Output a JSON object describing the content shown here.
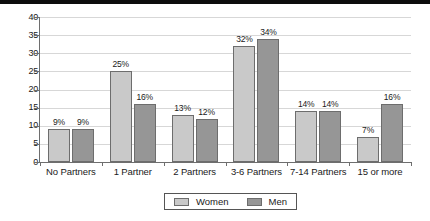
{
  "chart_data": {
    "type": "bar",
    "title": "",
    "subtitle": "",
    "xlabel": "",
    "ylabel": "",
    "ylim": [
      0,
      40
    ],
    "ytick_step": 5,
    "yticks": [
      "0",
      "5",
      "10",
      "15",
      "20",
      "25",
      "30",
      "35",
      "40"
    ],
    "grid": true,
    "legend_position": "bottom-center",
    "categories": [
      "No Partners",
      "1 Partner",
      "2 Partners",
      "3-6 Partners",
      "7-14 Partners",
      "15 or more"
    ],
    "series": [
      {
        "name": "Women",
        "color": "#c9c9c9",
        "values": [
          9,
          25,
          13,
          32,
          14,
          7
        ],
        "labels": [
          "9%",
          "25%",
          "13%",
          "32%",
          "14%",
          "7%"
        ]
      },
      {
        "name": "Men",
        "color": "#969696",
        "values": [
          9,
          16,
          12,
          34,
          14,
          16
        ],
        "labels": [
          "9%",
          "16%",
          "12%",
          "34%",
          "14%",
          "16%"
        ]
      }
    ]
  },
  "legend": {
    "items": [
      {
        "label": "Women"
      },
      {
        "label": "Men"
      }
    ]
  },
  "colors": {
    "women": "#c9c9c9",
    "men": "#969696",
    "grid": "#d7d7d7",
    "axis": "#6e6e6e",
    "bar_border": "#6d6d6d",
    "top_strip": "#0d0d0d"
  }
}
